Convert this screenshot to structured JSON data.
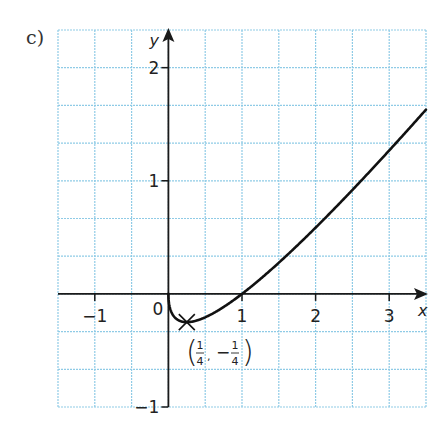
{
  "part_label": "c)",
  "colors": {
    "grid": "#8fcbe6",
    "axis": "#1a1a1a",
    "curve": "#111111",
    "background": "#ffffff"
  },
  "chart_data": {
    "type": "line",
    "title": "",
    "function": "y = x - sqrt(x)",
    "xlabel": "x",
    "ylabel": "y",
    "xlim": [
      -1.5,
      3.5
    ],
    "ylim": [
      -1,
      2.333
    ],
    "grid": true,
    "grid_spacing": {
      "x": 0.5,
      "y": 0.3333
    },
    "x_ticks": [
      {
        "value": -1,
        "label": "−1"
      },
      {
        "value": 1,
        "label": "1"
      },
      {
        "value": 2,
        "label": "2"
      },
      {
        "value": 3,
        "label": "3"
      }
    ],
    "y_ticks": [
      {
        "value": 2,
        "label": "2"
      },
      {
        "value": 1,
        "label": "1"
      },
      {
        "value": -1,
        "label": "−1"
      }
    ],
    "origin_label": "0",
    "series": [
      {
        "name": "curve",
        "x": [
          0,
          0.01,
          0.04,
          0.1,
          0.25,
          0.5,
          0.75,
          1,
          1.5,
          2,
          2.5,
          3,
          3.5
        ],
        "values": [
          0,
          -0.09,
          -0.16,
          -0.216,
          -0.25,
          -0.207,
          -0.116,
          0,
          0.275,
          0.586,
          0.919,
          1.268,
          1.629
        ]
      }
    ],
    "annotations": [
      {
        "type": "marker",
        "marker": "cross",
        "x": 0.25,
        "y": -0.25,
        "label": "(1/4, −1/4)",
        "label_parts": {
          "x_num": "1",
          "x_den": "4",
          "y_sign": "−",
          "y_num": "1",
          "y_den": "4",
          "sep": ","
        }
      }
    ]
  }
}
